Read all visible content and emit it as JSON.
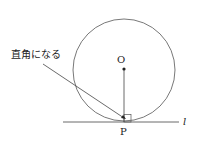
{
  "diagram": {
    "annotation": "直角になる",
    "center_label": "O",
    "point_label": "P",
    "line_label": "l",
    "colors": {
      "stroke": "#333333",
      "background": "#ffffff"
    }
  }
}
